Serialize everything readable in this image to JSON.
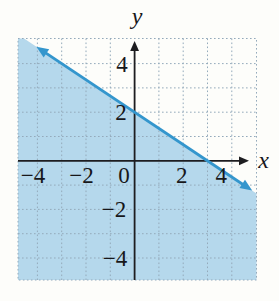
{
  "page": {
    "background": "#fdfdfa"
  },
  "chart_data": {
    "type": "line",
    "subtype": "linear-inequality-graph",
    "title": "",
    "xlabel": "x",
    "ylabel": "y",
    "xlim": [
      -4.8,
      5.0
    ],
    "ylim": [
      -4.9,
      5.0
    ],
    "grid": true,
    "grid_style": "dotted",
    "grid_interval": 1,
    "x_tick_labels": [
      {
        "v": -4,
        "label": "−4",
        "dx": -4.5
      },
      {
        "v": -2,
        "label": "−2",
        "dx": -4.5
      },
      {
        "v": 0,
        "label": "0",
        "dx": -10.5
      },
      {
        "v": 2,
        "label": "2",
        "dx": -1.5
      },
      {
        "v": 4,
        "label": "4",
        "dx": -10.5
      }
    ],
    "y_tick_labels": [
      {
        "v": 4,
        "label": "4",
        "dx": -12.5
      },
      {
        "v": 2,
        "label": "2",
        "dx": -13.5
      },
      {
        "v": -2,
        "label": "−2",
        "dx": -20.5
      },
      {
        "v": -4,
        "label": "−4",
        "dx": -19.5
      }
    ],
    "boundary_line": {
      "points_on_line": [
        [
          0,
          2
        ],
        [
          3,
          0
        ]
      ],
      "y_intercept": 2,
      "x_intercept": 3,
      "slope": -0.6667,
      "style": "solid",
      "arrows": "both-ends",
      "segment_x_range": [
        -3.8,
        4.6
      ]
    },
    "shaded_region": "below-line",
    "colors": {
      "shade": "#b5d8ec",
      "line": "#3496cd",
      "axis": "#1d1d20",
      "grid": "#94aabb",
      "text": "#17171a"
    }
  }
}
